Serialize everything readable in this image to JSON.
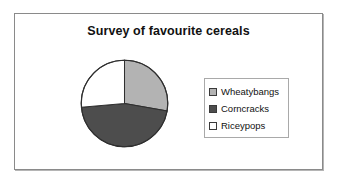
{
  "chart_data": {
    "type": "pie",
    "title": "Survey of favourite cereals",
    "categories": [
      "Wheatybangs",
      "Corncracks",
      "Riceypops"
    ],
    "values": [
      28,
      46,
      26
    ],
    "units": "percent",
    "colors": [
      "#b3b3b3",
      "#4d4d4d",
      "#ffffff"
    ],
    "slice_start_angles_deg": [
      0,
      100,
      265
    ],
    "slice_end_angles_deg": [
      100,
      265,
      360
    ],
    "start_angle_deg": 0,
    "direction": "clockwise",
    "legend_position": "right",
    "grid": false,
    "xlabel": "",
    "ylabel": "",
    "slices": [
      {
        "label": "Wheatybangs",
        "value": 28,
        "color": "#b3b3b3",
        "start_deg": 0,
        "end_deg": 100
      },
      {
        "label": "Corncracks",
        "value": 46,
        "color": "#4d4d4d",
        "start_deg": 100,
        "end_deg": 265
      },
      {
        "label": "Riceypops",
        "value": 26,
        "color": "#ffffff",
        "start_deg": 265,
        "end_deg": 360
      }
    ]
  },
  "legend": {
    "items": [
      {
        "label": "Wheatybangs",
        "swatch": "#b3b3b3"
      },
      {
        "label": "Corncracks",
        "swatch": "#4d4d4d"
      },
      {
        "label": "Riceypops",
        "swatch": "#ffffff"
      }
    ]
  },
  "icons": {
    "swatch": "legend-swatch-icon"
  }
}
